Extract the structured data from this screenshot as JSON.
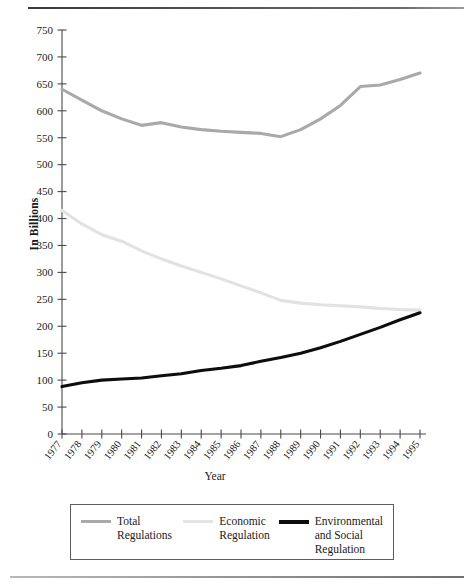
{
  "chart_data": {
    "type": "line",
    "title": "",
    "xlabel": "Year",
    "ylabel": "In Billions",
    "x": [
      1977,
      1978,
      1979,
      1980,
      1981,
      1982,
      1983,
      1984,
      1985,
      1986,
      1987,
      1988,
      1989,
      1990,
      1991,
      1992,
      1993,
      1994,
      1995
    ],
    "xtick_labels": [
      "1977",
      "1978",
      "1979",
      "1980",
      "1981",
      "1982",
      "1983",
      "1984",
      "1985",
      "1986",
      "1987",
      "1988",
      "1989",
      "1990",
      "1991",
      "1992",
      "1993",
      "1994",
      "1995"
    ],
    "ylim": [
      0,
      750
    ],
    "ytick_labels": [
      "0",
      "50",
      "100",
      "150",
      "200",
      "250",
      "300",
      "350",
      "400",
      "450",
      "500",
      "550",
      "600",
      "650",
      "700",
      "750"
    ],
    "ytick_values": [
      0,
      50,
      100,
      150,
      200,
      250,
      300,
      350,
      400,
      450,
      500,
      550,
      600,
      650,
      700,
      750
    ],
    "grid": false,
    "legend_position": "bottom",
    "series": [
      {
        "name": "Total Regulations",
        "legend_label_lines": [
          "Total",
          "Regulations"
        ],
        "color": "#a9a9a9",
        "values": [
          640,
          620,
          600,
          585,
          573,
          578,
          570,
          565,
          562,
          560,
          558,
          552,
          565,
          585,
          610,
          645,
          648,
          658,
          670
        ]
      },
      {
        "name": "Economic Regulation",
        "legend_label_lines": [
          "Economic",
          "Regulation"
        ],
        "color": "#e2e2e2",
        "values": [
          415,
          390,
          370,
          358,
          340,
          325,
          312,
          300,
          288,
          275,
          262,
          248,
          243,
          240,
          238,
          236,
          233,
          231,
          230
        ]
      },
      {
        "name": "Environmental and Social Regulation",
        "legend_label_lines": [
          "Environmental",
          "and Social",
          "Regulation"
        ],
        "color": "#0d0d0d",
        "values": [
          88,
          95,
          100,
          102,
          104,
          108,
          112,
          118,
          122,
          127,
          135,
          142,
          150,
          160,
          172,
          185,
          198,
          212,
          225
        ]
      }
    ]
  },
  "axis": {
    "y_title": "In Billions",
    "x_title": "Year"
  }
}
